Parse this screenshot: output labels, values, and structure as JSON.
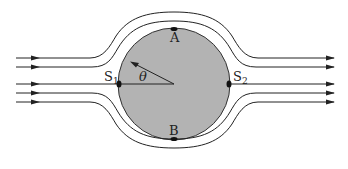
{
  "diagram": {
    "labels": {
      "top_point": "A",
      "bottom_point": "B",
      "left_stagnation": "S",
      "left_stagnation_sub": "1",
      "right_stagnation": "S",
      "right_stagnation_sub": "2",
      "angle": "θ"
    },
    "colors": {
      "cylinder_fill": "#b3b3b3",
      "line": "#222222",
      "background": "#ffffff"
    },
    "cylinder": {
      "cx": 174,
      "cy": 84,
      "r": 56
    },
    "streamlines_count": 9
  }
}
